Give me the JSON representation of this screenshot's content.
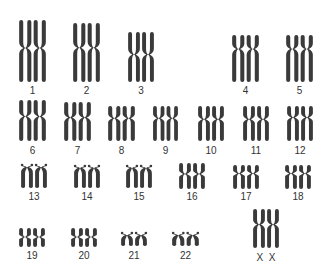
{
  "colors": {
    "chromatid": "#3a3a3a",
    "label": "#333333",
    "background": "#ffffff"
  },
  "pairs": [
    {
      "id": "1",
      "label": "1"
    },
    {
      "id": "2",
      "label": "2"
    },
    {
      "id": "3",
      "label": "3"
    },
    {
      "id": "4",
      "label": "4"
    },
    {
      "id": "5",
      "label": "5"
    },
    {
      "id": "6",
      "label": "6"
    },
    {
      "id": "7",
      "label": "7"
    },
    {
      "id": "8",
      "label": "8"
    },
    {
      "id": "9",
      "label": "9"
    },
    {
      "id": "10",
      "label": "10"
    },
    {
      "id": "11",
      "label": "11"
    },
    {
      "id": "12",
      "label": "12"
    },
    {
      "id": "13",
      "label": "13"
    },
    {
      "id": "14",
      "label": "14"
    },
    {
      "id": "15",
      "label": "15"
    },
    {
      "id": "16",
      "label": "16"
    },
    {
      "id": "17",
      "label": "17"
    },
    {
      "id": "18",
      "label": "18"
    },
    {
      "id": "19",
      "label": "19"
    },
    {
      "id": "20",
      "label": "20"
    },
    {
      "id": "21",
      "label": "21"
    },
    {
      "id": "22",
      "label": "22"
    },
    {
      "id": "XX",
      "label": "X  X"
    }
  ]
}
